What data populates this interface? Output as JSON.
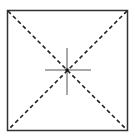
{
  "diagram": {
    "kind": "square-with-diagonals-and-crosshair",
    "colors": {
      "background": "#ffffff",
      "stroke": "#333333",
      "crosshair": "#555555"
    },
    "square": {
      "x": 7,
      "y": 10,
      "width": 120,
      "height": 120
    },
    "diagonals": {
      "style": "dashed"
    },
    "center": {
      "x": 67,
      "y": 70
    },
    "crosshair": {
      "half_length_h": 22,
      "half_length_v": 23
    }
  }
}
